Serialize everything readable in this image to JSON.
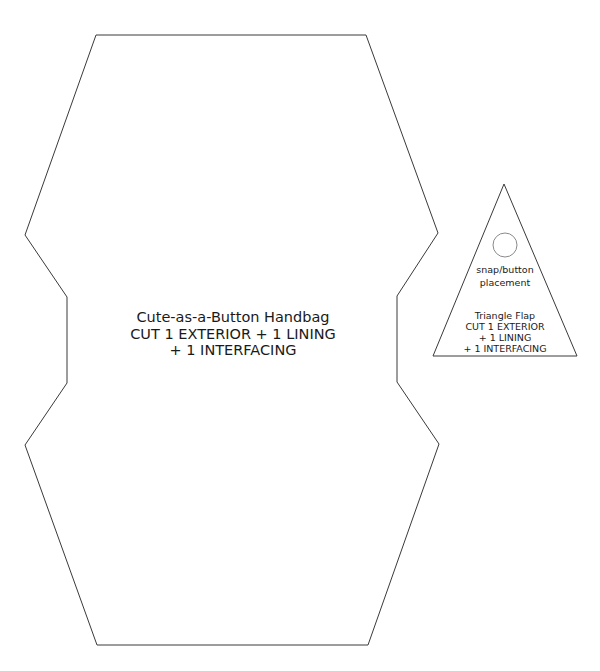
{
  "handbag_piece": {
    "title": "Cute-as-a-Button Handbag",
    "cut_line_1": "CUT 1 EXTERIOR + 1 LINING",
    "cut_line_2": "+ 1 INTERFACING",
    "outline_points": "96,35 366,35 438,233 397,296 397,382 439,444 368,645 97,645 25,445 67,383 67,297 25,235"
  },
  "triangle_flap": {
    "snap_line_1": "snap/button",
    "snap_line_2": "placement",
    "title": "Triangle Flap",
    "cut_line_1": "CUT 1 EXTERIOR",
    "cut_line_2": "+ 1 LINING",
    "cut_line_3": "+ 1 INTERFACING",
    "outline_points": "504,184 577,356 433,356",
    "snap_marker": {
      "cx": 505,
      "cy": 245,
      "r": 12
    }
  },
  "colors": {
    "background": "#ffffff",
    "outline": "#3a3a3a",
    "snap_marker": "#8a8a8a",
    "text": "#1a1a1a"
  }
}
